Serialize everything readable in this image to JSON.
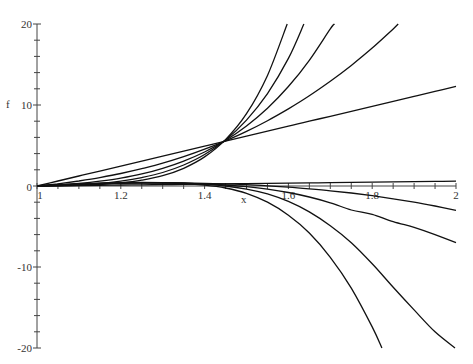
{
  "chart_data": {
    "type": "line",
    "title": "",
    "xlabel": "x",
    "ylabel": "f",
    "xlim": [
      1,
      2
    ],
    "ylim": [
      -20,
      20
    ],
    "grid": false,
    "legend": null,
    "x_ticks": [
      {
        "value": 1,
        "label": "1"
      },
      {
        "value": 1.2,
        "label": "1.2"
      },
      {
        "value": 1.4,
        "label": "1.4"
      },
      {
        "value": 1.6,
        "label": "1.6"
      },
      {
        "value": 1.8,
        "label": "1.8"
      },
      {
        "value": 2,
        "label": "2"
      }
    ],
    "y_ticks": [
      {
        "value": 20,
        "label": "20"
      },
      {
        "value": 10,
        "label": "10"
      },
      {
        "value": 0,
        "label": "0"
      },
      {
        "value": -10,
        "label": "-10"
      },
      {
        "value": -20,
        "label": "-20"
      }
    ],
    "x": [
      1.0,
      1.05,
      1.1,
      1.15,
      1.2,
      1.25,
      1.3,
      1.35,
      1.4,
      1.45,
      1.5,
      1.55,
      1.6,
      1.65,
      1.7,
      1.75,
      1.8,
      1.85,
      1.9,
      1.95,
      2.0
    ],
    "series": [
      {
        "name": "upper-1",
        "values": [
          0,
          0.615,
          1.23,
          1.845,
          2.46,
          3.075,
          3.69,
          4.305,
          4.92,
          5.535,
          6.15,
          6.765,
          7.38,
          7.995,
          8.61,
          9.225,
          9.84,
          10.455,
          11.07,
          11.685,
          12.3
        ]
      },
      {
        "name": "upper-2",
        "values": [
          0,
          0.277,
          0.622,
          1.042,
          1.545,
          2.14,
          2.83,
          3.63,
          4.55,
          5.58,
          6.75,
          8.06,
          9.52,
          11.14,
          12.93,
          14.89,
          17.04,
          19.39,
          21.9,
          null,
          null
        ]
      },
      {
        "name": "upper-3",
        "values": [
          0,
          0.125,
          0.315,
          0.589,
          0.971,
          1.49,
          2.18,
          3.07,
          4.2,
          5.63,
          7.41,
          9.61,
          12.28,
          15.52,
          19.4,
          22.4,
          null,
          null,
          null,
          null,
          null
        ]
      },
      {
        "name": "upper-4",
        "values": [
          0,
          0.056,
          0.159,
          0.332,
          0.61,
          1.04,
          1.67,
          2.59,
          3.89,
          5.68,
          8.13,
          11.4,
          15.75,
          21.5,
          null,
          null,
          null,
          null,
          null,
          null,
          null
        ]
      },
      {
        "name": "upper-5",
        "values": [
          0,
          0.025,
          0.08,
          0.188,
          0.384,
          0.722,
          1.28,
          2.19,
          3.59,
          5.73,
          8.93,
          13.66,
          20.4,
          null,
          null,
          null,
          null,
          null,
          null,
          null,
          null
        ]
      },
      {
        "name": "lower-1",
        "values": [
          0,
          0.03,
          0.06,
          0.09,
          0.12,
          0.15,
          0.18,
          0.21,
          0.24,
          0.27,
          0.3,
          0.33,
          0.36,
          0.39,
          0.42,
          0.45,
          0.48,
          0.51,
          0.54,
          0.57,
          0.6
        ]
      },
      {
        "name": "lower-2",
        "values": [
          0,
          0.109,
          0.202,
          0.277,
          0.334,
          0.368,
          0.38,
          0.367,
          0.327,
          0.258,
          0.16,
          0.027,
          -0.139,
          -0.343,
          -0.587,
          -0.87,
          -1.2,
          -1.58,
          -2.0,
          -2.47,
          -3.0
        ]
      },
      {
        "name": "lower-3",
        "values": [
          0,
          0.12,
          0.22,
          0.3,
          0.36,
          0.38,
          0.37,
          0.33,
          0.25,
          0.12,
          -0.08,
          -0.38,
          -0.8,
          -1.36,
          -2.07,
          -2.96,
          -3.5,
          -4.4,
          -5.1,
          -6.0,
          -7.0
        ]
      },
      {
        "name": "lower-4",
        "values": [
          0,
          0.13,
          0.24,
          0.33,
          0.39,
          0.42,
          0.41,
          0.35,
          0.22,
          0.0,
          -0.38,
          -0.98,
          -1.9,
          -3.2,
          -4.9,
          -7.0,
          -9.6,
          -12.5,
          -15.3,
          -18.0,
          -20.1
        ]
      },
      {
        "name": "lower-5",
        "values": [
          0,
          0.13,
          0.25,
          0.35,
          0.42,
          0.44,
          0.41,
          0.31,
          0.1,
          -0.25,
          -0.9,
          -2.0,
          -3.6,
          -5.8,
          -8.8,
          -12.6,
          -17.4,
          -23.0,
          null,
          null,
          null
        ]
      }
    ]
  }
}
